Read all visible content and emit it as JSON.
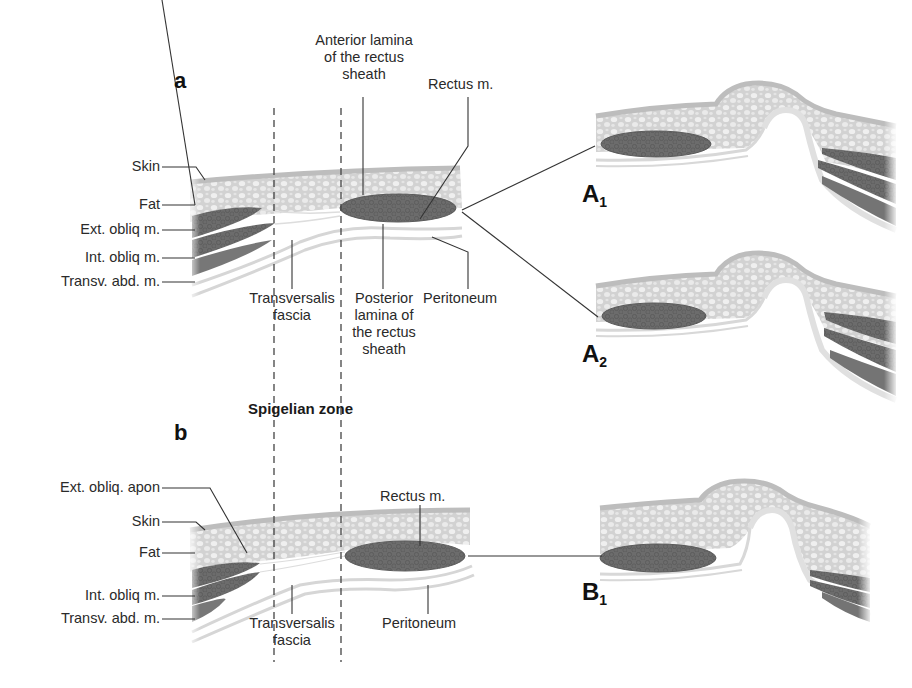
{
  "figure": {
    "panels": [
      {
        "id": "a",
        "letter": "a",
        "left_labels": [
          "Skin",
          "Fat",
          "Ext. obliq m.",
          "Int. obliq m.",
          "Transv. abd. m."
        ],
        "top_labels": {
          "anterior_lamina": [
            "Anterior lamina",
            "of the rectus",
            "sheath"
          ],
          "rectus": "Rectus m."
        },
        "bottom_labels": {
          "transversalis": [
            "Transversalis",
            "fascia"
          ],
          "posterior_lamina": [
            "Posterior",
            "lamina of",
            "the rectus",
            "sheath"
          ],
          "peritoneum": "Peritoneum"
        },
        "variants": [
          {
            "letter": "A",
            "subscript": "1"
          },
          {
            "letter": "A",
            "subscript": "2"
          }
        ]
      },
      {
        "id": "b",
        "letter": "b",
        "left_labels": [
          "Ext. obliq. apon",
          "Skin",
          "Fat",
          "Int. obliq m.",
          "Transv. abd. m."
        ],
        "top_labels": {
          "rectus": "Rectus m."
        },
        "bottom_labels": {
          "transversalis": [
            "Transversalis",
            "fascia"
          ],
          "peritoneum": "Peritoneum"
        },
        "variants": [
          {
            "letter": "B",
            "subscript": "1"
          }
        ]
      }
    ],
    "zone_label": "Spigelian zone",
    "colors": {
      "skin": "#c9c9c9",
      "fat": "#d4d4d4",
      "fat_globule": "#ececec",
      "muscle": "#6e6e6e",
      "muscle_dark": "#5a5a5a",
      "fascia": "#e6e6e6",
      "line": "#333333",
      "background": "#ffffff"
    }
  }
}
